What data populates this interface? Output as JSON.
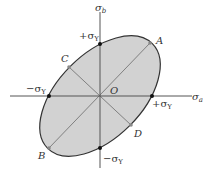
{
  "figure": {
    "type": "yield-ellipse",
    "colors": {
      "fill": "#d2d2d2",
      "outline": "#333333",
      "axis": "#555555",
      "diameter": "#808080",
      "point": "#111111",
      "marker": "#888888",
      "text": "#333333"
    },
    "axes": {
      "horizontal": {
        "symbol": "σ",
        "subscript": "a"
      },
      "vertical": {
        "symbol": "σ",
        "subscript": "b"
      },
      "origin": "O"
    },
    "intercepts": {
      "top": {
        "prefix": "+σ",
        "subscript": "Y"
      },
      "bottom": {
        "prefix": "−σ",
        "subscript": "Y"
      },
      "left": {
        "prefix": "−σ",
        "subscript": "Y"
      },
      "right": {
        "prefix": "+σ",
        "subscript": "Y"
      }
    },
    "points": {
      "A": "A",
      "B": "B",
      "C": "C",
      "D": "D"
    }
  }
}
